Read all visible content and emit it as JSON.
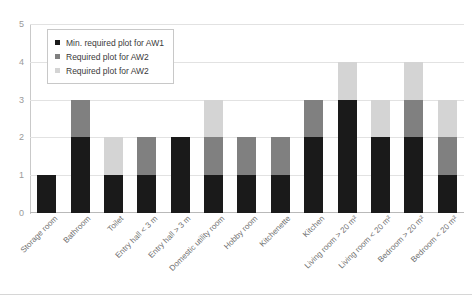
{
  "chart_data": {
    "type": "bar",
    "stacked": true,
    "title": "",
    "xlabel": "",
    "ylabel": "",
    "ylim": [
      0,
      5
    ],
    "yticks": [
      0,
      1,
      2,
      3,
      4,
      5
    ],
    "grid": true,
    "legend_position": "top-left",
    "categories": [
      "Storage room",
      "Bathroom",
      "Toilet",
      "Entry hall < 3 m",
      "Entry hall > 3 m",
      "Domestic utility room",
      "Hobby room",
      "Kitchenette",
      "Kitchen",
      "Living room > 20 m²",
      "Living room < 20 m²",
      "Bedroom > 20 m²",
      "Bedroom < 20 m²"
    ],
    "series": [
      {
        "name": "Min. required plot for AW1",
        "color": "#1a1a1a",
        "values": [
          1,
          2,
          1,
          1,
          2,
          1,
          1,
          1,
          2,
          3,
          2,
          2,
          1
        ]
      },
      {
        "name": "Required plot for AW2",
        "color": "#808080",
        "values": [
          0,
          1,
          0,
          1,
          0,
          1,
          1,
          1,
          1,
          0,
          0,
          1,
          1
        ]
      },
      {
        "name": "Required plot for AW2",
        "color": "#d4d4d4",
        "values": [
          0,
          0,
          1,
          0,
          0,
          1,
          0,
          0,
          0,
          1,
          1,
          1,
          1
        ]
      }
    ],
    "totals": [
      1,
      3,
      2,
      2,
      2,
      3,
      2,
      2,
      3,
      4,
      3,
      4,
      3
    ]
  },
  "colors": {
    "series_1": "#1a1a1a",
    "series_2": "#808080",
    "series_3": "#d4d4d4",
    "gridline": "#e2e2e2",
    "axis": "#c9c9c9",
    "tick_text": "#9a9a9a",
    "label_text": "#6f6f6f",
    "legend_text": "#3a3a3a",
    "legend_border": "#c8c8c8",
    "background": "#ffffff"
  }
}
